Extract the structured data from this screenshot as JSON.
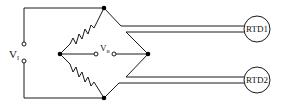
{
  "diagram": {
    "labels": {
      "supply_voltage": "V",
      "supply_voltage_sub": "I",
      "bridge_voltage": "V",
      "bridge_voltage_sub": "B",
      "rtd1": "RTD1",
      "rtd2": "RTD2"
    },
    "components": [
      {
        "id": "R1",
        "type": "resistor",
        "position": "upper-left arm"
      },
      {
        "id": "R2",
        "type": "resistor",
        "position": "lower-left arm"
      },
      {
        "id": "RTD1",
        "type": "rtd",
        "position": "upper-right arm (remote)"
      },
      {
        "id": "RTD2",
        "type": "rtd",
        "position": "lower-right arm (remote)"
      },
      {
        "id": "VI",
        "type": "voltage-source-terminals"
      },
      {
        "id": "VB",
        "type": "output-terminals"
      }
    ],
    "colors": {
      "line": "#1a1a1a",
      "background": "#ffffff"
    }
  }
}
